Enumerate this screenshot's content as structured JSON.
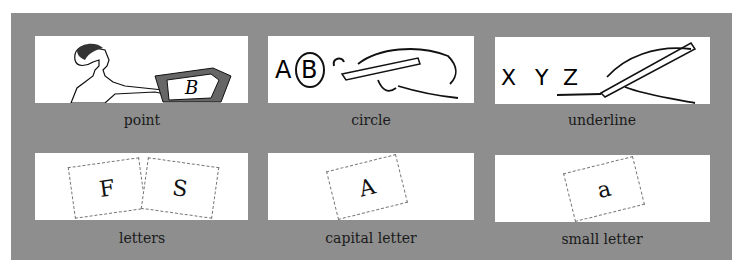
{
  "panels": [
    {
      "id": "point",
      "caption": "point",
      "art_letters": [
        "B"
      ]
    },
    {
      "id": "circle",
      "caption": "circle",
      "art_letters": [
        "A",
        "B",
        "C"
      ]
    },
    {
      "id": "underline",
      "caption": "underline",
      "art_letters": [
        "X",
        "Y",
        "Z"
      ]
    },
    {
      "id": "letters",
      "caption": "letters",
      "tiles": [
        "F",
        "S"
      ]
    },
    {
      "id": "capital-letter",
      "caption": "capital letter",
      "tiles": [
        "A"
      ]
    },
    {
      "id": "small-letter",
      "caption": "small letter",
      "tiles": [
        "a"
      ]
    }
  ],
  "colors": {
    "board": "#8e8e8e",
    "card": "#ffffff",
    "ink": "#111111"
  }
}
